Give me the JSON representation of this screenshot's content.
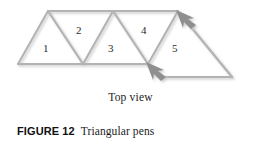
{
  "figure": {
    "number_label": "FIGURE 12",
    "title": "Triangular pens",
    "subcaption": "Top view"
  },
  "colors": {
    "line": "#b3b3b3",
    "line_shadow": "#d8d8d8",
    "arrow_fill": "#8f8f8f",
    "arrow_shadow": "#d5d5d5",
    "text": "#1c1c1c",
    "background": "#ffffff"
  },
  "diagram": {
    "name": "triangular-pens-top-view",
    "pens": [
      {
        "id": "pen-1",
        "label": "1",
        "x": 45,
        "y": 48
      },
      {
        "id": "pen-2",
        "label": "2",
        "x": 78,
        "y": 30
      },
      {
        "id": "pen-3",
        "label": "3",
        "x": 110,
        "y": 48
      },
      {
        "id": "pen-4",
        "label": "4",
        "x": 143,
        "y": 30
      },
      {
        "id": "pen-5",
        "label": "5",
        "x": 174,
        "y": 48
      }
    ],
    "arrows": [
      {
        "id": "arrow-upper-right",
        "direction": "up-left",
        "tip_x": 178,
        "tip_y": 12
      },
      {
        "id": "arrow-lower-middle",
        "direction": "up-left",
        "tip_x": 148,
        "tip_y": 64
      }
    ]
  }
}
